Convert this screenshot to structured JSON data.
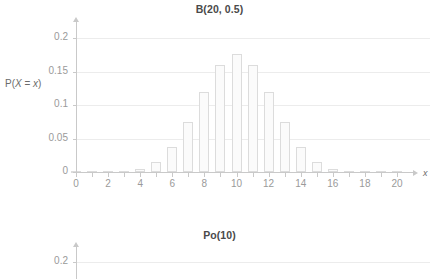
{
  "chart_data": [
    {
      "type": "bar",
      "title": "B(20, 0.5)",
      "xlabel": "x",
      "ylabel": "P(X = x)",
      "ylabel_parts": {
        "prefix": "P(",
        "var_upper": "X",
        "equals": " = ",
        "var_lower": "x",
        "suffix": ")"
      },
      "categories": [
        0,
        1,
        2,
        3,
        4,
        5,
        6,
        7,
        8,
        9,
        10,
        11,
        12,
        13,
        14,
        15,
        16,
        17,
        18,
        19,
        20
      ],
      "values": [
        1e-06,
        1.9e-05,
        0.000181,
        0.001087,
        0.004621,
        0.014786,
        0.036964,
        0.073929,
        0.120134,
        0.160179,
        0.176197,
        0.160179,
        0.120134,
        0.073929,
        0.036964,
        0.014786,
        0.004621,
        0.001087,
        0.000181,
        1.9e-05,
        1e-06
      ],
      "xlim": [
        0,
        20
      ],
      "ylim": [
        0,
        0.2
      ],
      "x_ticks": [
        0,
        1,
        2,
        3,
        4,
        5,
        6,
        7,
        8,
        9,
        10,
        11,
        12,
        13,
        14,
        15,
        16,
        17,
        18,
        19,
        20
      ],
      "x_tick_labels": [
        "0",
        "",
        "2",
        "",
        "4",
        "",
        "6",
        "",
        "8",
        "",
        "10",
        "",
        "12",
        "",
        "14",
        "",
        "16",
        "",
        "18",
        "",
        "20"
      ],
      "y_ticks": [
        0,
        0.05,
        0.1,
        0.15,
        0.2
      ],
      "y_tick_labels": [
        "0",
        "0.05",
        "0.1",
        "0.15",
        "0.2"
      ],
      "grid": true,
      "legend": "none"
    },
    {
      "type": "bar",
      "title": "Po(10)",
      "xlabel": "",
      "ylabel": "",
      "categories": [],
      "values": [],
      "ylim": [
        0,
        0.2
      ],
      "y_ticks": [
        0.2
      ],
      "y_tick_labels": [
        "0.2"
      ],
      "grid": true,
      "legend": "none",
      "note_clipped": "chart cropped at bottom of screenshot"
    }
  ],
  "colors": {
    "bar_fill": "#fbfbfb",
    "bar_stroke": "#dcdcdc",
    "gridline": "#ececec",
    "axis": "#c9c9c9",
    "tick_text": "#9a9a9a",
    "title_text": "#4a4a4a",
    "label_text": "#6b6b6b"
  }
}
